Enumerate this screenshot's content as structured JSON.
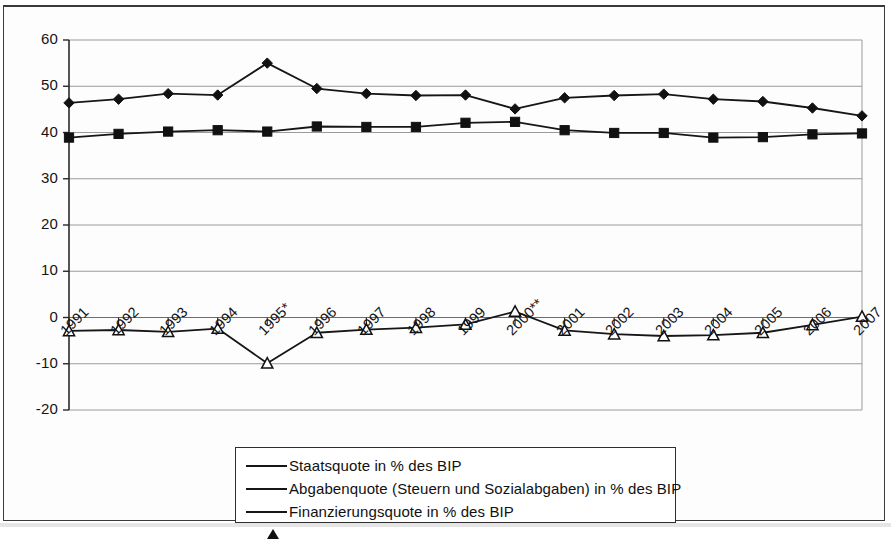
{
  "chart_data": {
    "type": "line",
    "title": "",
    "subtitle": "",
    "xlabel": "",
    "ylabel": "",
    "grid": true,
    "legend_position": "bottom-center",
    "xlim_categories_first": "1991",
    "xlim_categories_last": "2007",
    "ylim": [
      -20,
      60
    ],
    "ytick_step": 10,
    "yticks": [
      "60",
      "50",
      "40",
      "30",
      "20",
      "10",
      "0",
      "-10",
      "-20"
    ],
    "ytick_values": [
      60,
      50,
      40,
      30,
      20,
      10,
      0,
      -10,
      -20
    ],
    "categories": [
      "1991",
      "1992",
      "1993",
      "1994",
      "1995*",
      "1996",
      "1997",
      "1998",
      "1999",
      "2000**",
      "2001",
      "2002",
      "2003",
      "2004",
      "2005",
      "2006",
      "2007"
    ],
    "series": [
      {
        "name": "Staatsquote in % des BIP",
        "marker": "diamond-filled",
        "values": [
          46.4,
          47.2,
          48.4,
          48.1,
          55.0,
          49.5,
          48.4,
          48.0,
          48.1,
          45.1,
          47.5,
          48.0,
          48.3,
          47.2,
          46.7,
          45.3,
          43.6
        ]
      },
      {
        "name": "Abgabenquote (Steuern und Sozialabgaben) in % des BIP",
        "marker": "square-filled",
        "values": [
          38.9,
          39.7,
          40.2,
          40.5,
          40.2,
          41.3,
          41.2,
          41.2,
          42.1,
          42.3,
          40.5,
          39.9,
          39.9,
          38.9,
          39.0,
          39.6,
          39.8
        ]
      },
      {
        "name": "Finanzierungsquote in % des BIP",
        "marker": "triangle-open",
        "values": [
          -2.9,
          -2.7,
          -3.1,
          -2.4,
          -9.9,
          -3.3,
          -2.6,
          -2.2,
          -1.5,
          1.3,
          -2.8,
          -3.6,
          -4.0,
          -3.8,
          -3.3,
          -1.6,
          0.2
        ]
      }
    ]
  },
  "legend": {
    "entries": [
      {
        "label": "Staatsquote in % des BIP",
        "marker": "diamond-filled"
      },
      {
        "label": "Abgabenquote (Steuern und Sozialabgaben) in % des BIP",
        "marker": "square-filled"
      },
      {
        "label": "Finanzierungsquote in % des BIP",
        "marker": "triangle-open"
      }
    ]
  }
}
